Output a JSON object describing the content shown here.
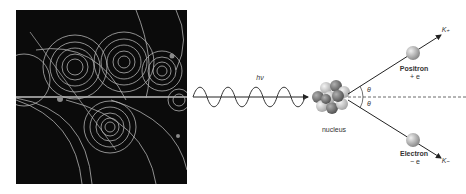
{
  "figure": {
    "left_panel": {
      "description": "Bubble chamber photograph of particle tracks (spirals)",
      "background": "#0b0b0b",
      "track_color": "#cfcfcf"
    },
    "right_panel": {
      "photon_label": "hν",
      "nucleus_label": "nucleus",
      "positron_label": "Positron",
      "positron_charge": "+ e",
      "electron_label": "Electron",
      "electron_charge": "− e",
      "k_plus": "K₊",
      "k_minus": "K₋",
      "angle_top": "θ",
      "angle_bottom": "θ",
      "colors": {
        "line": "#222222",
        "particle": "#bdbdbd",
        "nucleus_dark": "#7a7a7a",
        "nucleus_light": "#d6d6d6"
      }
    }
  }
}
